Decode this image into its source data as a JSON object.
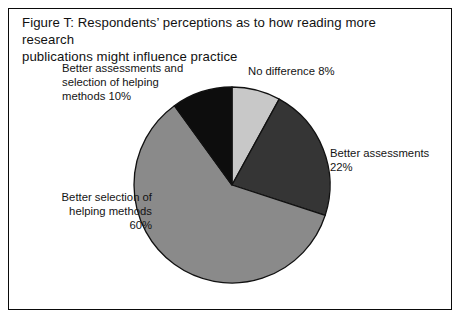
{
  "figure": {
    "title": "Figure T: Respondents’ perceptions as to how reading more research\npublications might influence practice",
    "frame_color": "#0a0a0a",
    "background": "#ffffff"
  },
  "chart_data": {
    "type": "pie",
    "title": "Figure T: Respondents’ perceptions as to how reading more research publications might influence practice",
    "xlabel": "",
    "ylabel": "",
    "units": "percent",
    "start_angle_deg": 0,
    "direction": "clockwise",
    "legend": "none",
    "grid": false,
    "categories": [
      "No difference",
      "Better assessments",
      "Better selection of helping methods",
      "Better assessments and selection of helping methods"
    ],
    "values": [
      8,
      22,
      60,
      10
    ],
    "colors": [
      "#c8c8c8",
      "#353535",
      "#8a8a8a",
      "#0d0d0d"
    ],
    "slice_border_color": "#111111",
    "center": {
      "x": 232,
      "y": 185
    },
    "radius": 98,
    "slices": [
      {
        "name": "No difference",
        "value": 8,
        "label": "No difference 8%",
        "color": "#c8c8c8",
        "start_deg": 0,
        "end_deg": 28.8
      },
      {
        "name": "Better assessments",
        "value": 22,
        "label": "Better assessments\n22%",
        "color": "#353535",
        "start_deg": 28.8,
        "end_deg": 108.0
      },
      {
        "name": "Better selection of helping methods",
        "value": 60,
        "label": "Better selection of\nhelping methods\n60%",
        "color": "#8a8a8a",
        "start_deg": 108.0,
        "end_deg": 324.0
      },
      {
        "name": "Better assessments and selection of helping methods",
        "value": 10,
        "label": "Better assessments and\nselection of helping\nmethods 10%",
        "color": "#0d0d0d",
        "start_deg": 324.0,
        "end_deg": 360.0
      }
    ]
  }
}
